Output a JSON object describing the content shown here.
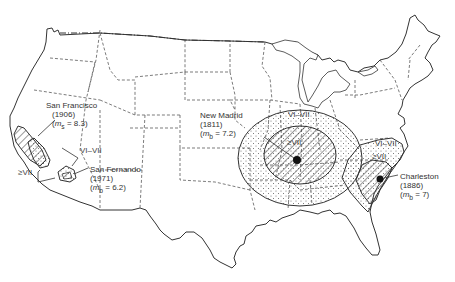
{
  "map": {
    "subject": "Isoseismal zones of major historical US earthquakes",
    "colors": {
      "line": "#333333",
      "background": "#ffffff"
    },
    "earthquakes": [
      {
        "name": "San Francisco",
        "year": "(1906)",
        "magnitude_symbol": "m",
        "magnitude_sub": "s",
        "magnitude_value": " = 8.3)"
      },
      {
        "name": "San Fernando",
        "year": "(1971)",
        "magnitude_symbol": "m",
        "magnitude_sub": "b",
        "magnitude_value": " = 6.2)"
      },
      {
        "name": "New Madrid",
        "year": "(1811)",
        "magnitude_symbol": "m",
        "magnitude_sub": "b",
        "magnitude_value": " = 7.2)"
      },
      {
        "name": "Charleston",
        "year": "(1886)",
        "magnitude_symbol": "m",
        "magnitude_sub": "b",
        "magnitude_value": " = 7)"
      }
    ],
    "zone_labels": {
      "west_vi_vii": "VI–VII",
      "west_ge_vii": "≥VII",
      "madrid_vi_vii": "VI–VII",
      "madrid_ge_vii": "≥VII",
      "charleston_vi_vii": "VI–VII",
      "charleston_ge_vii": "≥VII"
    },
    "legend": {
      "hatched": "Intensity ≥VII",
      "stippled": "Intensity VI–VII",
      "dashed": "State boundaries"
    }
  }
}
